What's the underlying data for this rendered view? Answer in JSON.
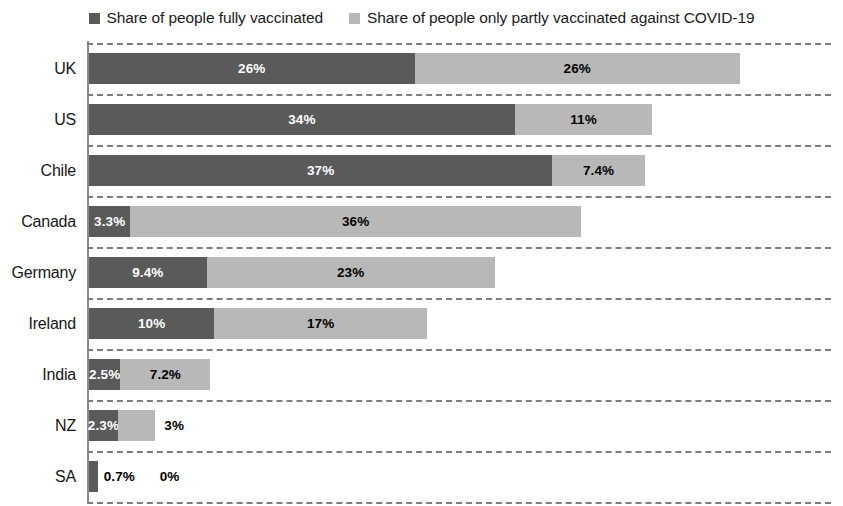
{
  "legend": {
    "entries": [
      {
        "label": "Share of people fully vaccinated",
        "swatch": "legend-swatch-fully",
        "color": "#5a5a5a"
      },
      {
        "label": "Share of people only partly vaccinated against COVID-19",
        "swatch": "legend-swatch-partly",
        "color": "#b8b8b8"
      }
    ]
  },
  "chart_data": {
    "type": "bar",
    "orientation": "horizontal",
    "stacked": true,
    "title": "",
    "subtitle": "",
    "xlabel": "",
    "ylabel": "",
    "xlim": [
      0,
      60
    ],
    "grid": "horizontal-dashed",
    "legend_position": "top-center",
    "categories": [
      "UK",
      "US",
      "Chile",
      "Canada",
      "Germany",
      "Ireland",
      "India",
      "NZ",
      "SA"
    ],
    "series": [
      {
        "name": "Share of people fully vaccinated",
        "color": "#5a5a5a",
        "values": [
          26,
          34,
          37,
          3.3,
          9.4,
          10,
          2.5,
          2.3,
          0.7
        ],
        "labels": [
          "26%",
          "34%",
          "37%",
          "3.3%",
          "9.4%",
          "10%",
          "2.5%",
          "2.3%",
          "0.7%"
        ]
      },
      {
        "name": "Share of people only partly vaccinated against COVID-19",
        "color": "#b8b8b8",
        "values": [
          26,
          11,
          7.4,
          36,
          23,
          17,
          7.2,
          3,
          0
        ],
        "labels": [
          "26%",
          "11%",
          "7.4%",
          "36%",
          "23%",
          "17%",
          "7.2%",
          "3%",
          "0%"
        ]
      }
    ]
  },
  "rows": [
    {
      "category": "UK",
      "full_value": 26,
      "full_label": "26%",
      "full_label_outside": false,
      "partly_value": 26,
      "partly_label": "26%",
      "partly_label_outside": false
    },
    {
      "category": "US",
      "full_value": 34,
      "full_label": "34%",
      "full_label_outside": false,
      "partly_value": 11,
      "partly_label": "11%",
      "partly_label_outside": false
    },
    {
      "category": "Chile",
      "full_value": 37,
      "full_label": "37%",
      "full_label_outside": false,
      "partly_value": 7.4,
      "partly_label": "7.4%",
      "partly_label_outside": false
    },
    {
      "category": "Canada",
      "full_value": 3.3,
      "full_label": "3.3%",
      "full_label_outside": false,
      "partly_value": 36,
      "partly_label": "36%",
      "partly_label_outside": false
    },
    {
      "category": "Germany",
      "full_value": 9.4,
      "full_label": "9.4%",
      "full_label_outside": false,
      "partly_value": 23,
      "partly_label": "23%",
      "partly_label_outside": false
    },
    {
      "category": "Ireland",
      "full_value": 10,
      "full_label": "10%",
      "full_label_outside": false,
      "partly_value": 17,
      "partly_label": "17%",
      "partly_label_outside": false
    },
    {
      "category": "India",
      "full_value": 2.5,
      "full_label": "2.5%",
      "full_label_outside": false,
      "partly_value": 7.2,
      "partly_label": "7.2%",
      "partly_label_outside": false
    },
    {
      "category": "NZ",
      "full_value": 2.3,
      "full_label": "2.3%",
      "full_label_outside": false,
      "partly_value": 3,
      "partly_label": "3%",
      "partly_label_outside": true
    },
    {
      "category": "SA",
      "full_value": 0.7,
      "full_label": "0.7%",
      "full_label_outside": true,
      "partly_value": 0,
      "partly_label": "0%",
      "partly_label_outside": true
    }
  ],
  "layout": {
    "px_per_percent": 12.52,
    "plot_left": 89,
    "row_height": 51,
    "bar_height": 31,
    "first_gridline_top": 7
  }
}
